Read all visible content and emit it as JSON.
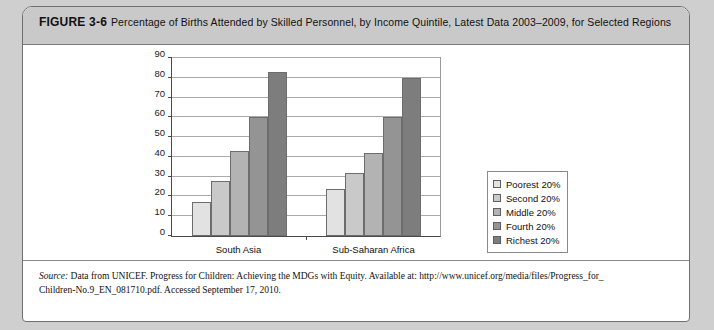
{
  "figure": {
    "label": "FIGURE 3-6",
    "caption": "Percentage of Births Attended by Skilled Personnel, by Income Quintile, Latest Data 2003–2009, for Selected Regions"
  },
  "source": {
    "prefix": "Source:",
    "line1": " Data from UNICEF. Progress for Children: Achieving the MDGs with Equity. Available at: http://www.unicef.org/media/files/Progress_for_",
    "line2": "Children-No.9_EN_081710.pdf. Accessed September 17, 2010."
  },
  "colors": {
    "series": [
      "#e2e2e2",
      "#c9c9c9",
      "#b3b3b3",
      "#949494",
      "#7d7d7d"
    ],
    "bar_border": "#6d6d6d",
    "grid": "#a9a9a9",
    "axis": "#4a4a4a",
    "caption_band": "#c9c9c9",
    "page_background": "#cfcfcf",
    "card_background": "#ffffff"
  },
  "chart_data": {
    "type": "bar",
    "title": "Percentage of Births Attended by Skilled Personnel, by Income Quintile, Latest Data 2003–2009, for Selected Regions",
    "xlabel": "",
    "ylabel": "",
    "ylim": [
      0,
      90
    ],
    "yticks": [
      0,
      10,
      20,
      30,
      40,
      50,
      60,
      70,
      80,
      90
    ],
    "grid": true,
    "legend_position": "right",
    "categories": [
      "South Asia",
      "Sub-Saharan Africa"
    ],
    "series": [
      {
        "name": "Poorest 20%",
        "values": [
          17,
          24
        ]
      },
      {
        "name": "Second 20%",
        "values": [
          28,
          32
        ]
      },
      {
        "name": "Middle 20%",
        "values": [
          43,
          42
        ]
      },
      {
        "name": "Fourth 20%",
        "values": [
          60,
          60
        ]
      },
      {
        "name": "Richest 20%",
        "values": [
          83,
          80
        ]
      }
    ]
  }
}
